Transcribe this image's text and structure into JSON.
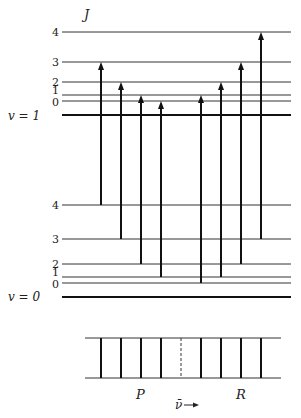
{
  "axis_label": "J",
  "vibrational_levels": [
    {
      "label": "v = 1",
      "v": 1,
      "rotational_levels": [
        {
          "J": 0,
          "label": "0"
        },
        {
          "J": 1,
          "label": "1"
        },
        {
          "J": 2,
          "label": "2"
        },
        {
          "J": 3,
          "label": "3"
        },
        {
          "J": 4,
          "label": "4"
        }
      ]
    },
    {
      "label": "v = 0",
      "v": 0,
      "rotational_levels": [
        {
          "J": 0,
          "label": "0"
        },
        {
          "J": 1,
          "label": "1"
        },
        {
          "J": 2,
          "label": "2"
        },
        {
          "J": 3,
          "label": "3"
        },
        {
          "J": 4,
          "label": "4"
        }
      ]
    }
  ],
  "transitions": [
    {
      "branch": "P",
      "from_J": 4,
      "to_J": 3
    },
    {
      "branch": "P",
      "from_J": 3,
      "to_J": 2
    },
    {
      "branch": "P",
      "from_J": 2,
      "to_J": 1
    },
    {
      "branch": "P",
      "from_J": 1,
      "to_J": 0
    },
    {
      "branch": "R",
      "from_J": 0,
      "to_J": 1
    },
    {
      "branch": "R",
      "from_J": 1,
      "to_J": 2
    },
    {
      "branch": "R",
      "from_J": 2,
      "to_J": 3
    },
    {
      "branch": "R",
      "from_J": 3,
      "to_J": 4
    }
  ],
  "spectrum": {
    "branch_labels": {
      "P": "P",
      "R": "R"
    },
    "axis_label": "ν̄",
    "arrow": "→",
    "band_center": "dashed"
  },
  "colors": {
    "line": "#333333",
    "thick": "#111111",
    "arrow": "#111111"
  }
}
